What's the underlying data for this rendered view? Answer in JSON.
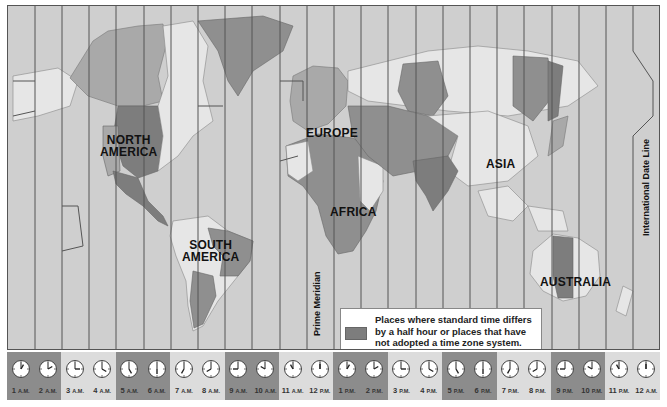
{
  "map": {
    "title": "World Time Zones",
    "continent_labels": [
      {
        "id": "north-america",
        "text": "NORTH\nAMERICA",
        "x": 102,
        "y": 128
      },
      {
        "id": "south-america",
        "text": "SOUTH\nAMERICA",
        "x": 183,
        "y": 233
      },
      {
        "id": "europe",
        "text": "EUROPE",
        "x": 304,
        "y": 121
      },
      {
        "id": "africa",
        "text": "AFRICA",
        "x": 326,
        "y": 200
      },
      {
        "id": "asia",
        "text": "ASIA",
        "x": 480,
        "y": 152
      },
      {
        "id": "australia",
        "text": "AUSTRALIA",
        "x": 525,
        "y": 270
      }
    ],
    "prime_meridian_label": "Prime Meridian",
    "date_line_label": "International Date Line",
    "colors": {
      "ocean": "#cfcfcf",
      "land_light": "#e6e6e6",
      "land_mid": "#a9a9a9",
      "land_dark": "#7d7d7d",
      "zone_line": "#555555"
    }
  },
  "legend": {
    "swatch_color": "#7d7d7d",
    "line1": "Places where standard time differs",
    "line2": "by a half hour or places that have",
    "line3": "not adopted a time zone system."
  },
  "clock_strip": [
    {
      "num": "1",
      "suffix": "A.M.",
      "hour": 1,
      "shade": "#8c8c8c"
    },
    {
      "num": "2",
      "suffix": "A.M.",
      "hour": 2,
      "shade": "#8c8c8c"
    },
    {
      "num": "3",
      "suffix": "A.M.",
      "hour": 3,
      "shade": "#dcdcdc"
    },
    {
      "num": "4",
      "suffix": "A.M.",
      "hour": 4,
      "shade": "#dcdcdc"
    },
    {
      "num": "5",
      "suffix": "A.M.",
      "hour": 5,
      "shade": "#8c8c8c"
    },
    {
      "num": "6",
      "suffix": "A.M.",
      "hour": 6,
      "shade": "#8c8c8c"
    },
    {
      "num": "7",
      "suffix": "A.M.",
      "hour": 7,
      "shade": "#dcdcdc"
    },
    {
      "num": "8",
      "suffix": "A.M.",
      "hour": 8,
      "shade": "#dcdcdc"
    },
    {
      "num": "9",
      "suffix": "A.M.",
      "hour": 9,
      "shade": "#8c8c8c"
    },
    {
      "num": "10",
      "suffix": "A.M.",
      "hour": 10,
      "shade": "#8c8c8c"
    },
    {
      "num": "11",
      "suffix": "A.M.",
      "hour": 11,
      "shade": "#dcdcdc"
    },
    {
      "num": "12",
      "suffix": "P.M.",
      "hour": 12,
      "shade": "#dcdcdc"
    },
    {
      "num": "1",
      "suffix": "P.M.",
      "hour": 1,
      "shade": "#8c8c8c"
    },
    {
      "num": "2",
      "suffix": "P.M.",
      "hour": 2,
      "shade": "#8c8c8c"
    },
    {
      "num": "3",
      "suffix": "P.M.",
      "hour": 3,
      "shade": "#dcdcdc"
    },
    {
      "num": "4",
      "suffix": "P.M.",
      "hour": 4,
      "shade": "#dcdcdc"
    },
    {
      "num": "5",
      "suffix": "P.M.",
      "hour": 5,
      "shade": "#8c8c8c"
    },
    {
      "num": "6",
      "suffix": "P.M.",
      "hour": 6,
      "shade": "#8c8c8c"
    },
    {
      "num": "7",
      "suffix": "P.M.",
      "hour": 7,
      "shade": "#dcdcdc"
    },
    {
      "num": "8",
      "suffix": "P.M.",
      "hour": 8,
      "shade": "#dcdcdc"
    },
    {
      "num": "9",
      "suffix": "P.M.",
      "hour": 9,
      "shade": "#8c8c8c"
    },
    {
      "num": "10",
      "suffix": "P.M.",
      "hour": 10,
      "shade": "#8c8c8c"
    },
    {
      "num": "11",
      "suffix": "P.M.",
      "hour": 11,
      "shade": "#dcdcdc"
    },
    {
      "num": "12",
      "suffix": "A.M.",
      "hour": 12,
      "shade": "#dcdcdc"
    }
  ]
}
